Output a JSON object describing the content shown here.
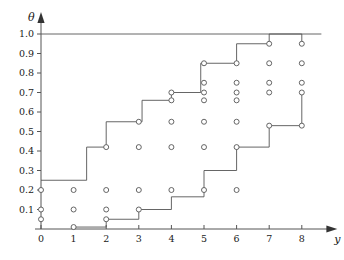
{
  "figure": {
    "title": "",
    "y_axis_name": "θ",
    "x_axis_name": "y",
    "background": "#ffffff",
    "line_color": "#555555",
    "marker_fill": "#ffffff",
    "text_color": "#1a1a1a"
  },
  "chart_data": {
    "type": "scatter",
    "title": "",
    "xlabel": "y",
    "ylabel": "θ",
    "xlim": [
      0,
      8.6
    ],
    "ylim": [
      0.0,
      1.06
    ],
    "grid": false,
    "legend": null,
    "x_ticks": [
      0,
      1,
      2,
      3,
      4,
      5,
      6,
      7,
      8
    ],
    "x_tick_labels": [
      "0",
      "1",
      "2",
      "3",
      "4",
      "5",
      "6",
      "7",
      "8"
    ],
    "y_ticks": [
      0.1,
      0.2,
      0.3,
      0.4,
      0.5,
      0.6,
      0.7,
      0.8,
      0.9,
      1.0
    ],
    "y_tick_labels": [
      "0.1",
      "0.2",
      "0.3",
      "0.4",
      "0.5",
      "0.6",
      "0.7",
      "0.8",
      "0.9",
      "1.0"
    ],
    "annotations": [
      {
        "name": "top-rule",
        "type": "hline",
        "y": 1.0,
        "x_from": 0,
        "x_to": 8.6
      }
    ],
    "series": [
      {
        "name": "points",
        "type": "scatter",
        "marker": "open-circle",
        "points": [
          {
            "x": 0,
            "y": 0.2
          },
          {
            "x": 0,
            "y": 0.1
          },
          {
            "x": 0,
            "y": 0.05
          },
          {
            "x": 1,
            "y": 0.2
          },
          {
            "x": 1,
            "y": 0.1
          },
          {
            "x": 1,
            "y": 0.01
          },
          {
            "x": 2,
            "y": 0.42
          },
          {
            "x": 2,
            "y": 0.2
          },
          {
            "x": 2,
            "y": 0.1
          },
          {
            "x": 2,
            "y": 0.05
          },
          {
            "x": 3,
            "y": 0.55
          },
          {
            "x": 3,
            "y": 0.42
          },
          {
            "x": 3,
            "y": 0.2
          },
          {
            "x": 3,
            "y": 0.1
          },
          {
            "x": 4,
            "y": 0.7
          },
          {
            "x": 4,
            "y": 0.66
          },
          {
            "x": 4,
            "y": 0.55
          },
          {
            "x": 4,
            "y": 0.42
          },
          {
            "x": 4,
            "y": 0.2
          },
          {
            "x": 5,
            "y": 0.85
          },
          {
            "x": 5,
            "y": 0.75
          },
          {
            "x": 5,
            "y": 0.7
          },
          {
            "x": 5,
            "y": 0.66
          },
          {
            "x": 5,
            "y": 0.55
          },
          {
            "x": 5,
            "y": 0.42
          },
          {
            "x": 5,
            "y": 0.2
          },
          {
            "x": 6,
            "y": 0.85
          },
          {
            "x": 6,
            "y": 0.75
          },
          {
            "x": 6,
            "y": 0.7
          },
          {
            "x": 6,
            "y": 0.66
          },
          {
            "x": 6,
            "y": 0.55
          },
          {
            "x": 6,
            "y": 0.42
          },
          {
            "x": 6,
            "y": 0.2
          },
          {
            "x": 7,
            "y": 0.95
          },
          {
            "x": 7,
            "y": 0.85
          },
          {
            "x": 7,
            "y": 0.75
          },
          {
            "x": 7,
            "y": 0.7
          },
          {
            "x": 7,
            "y": 0.53
          },
          {
            "x": 8,
            "y": 0.95
          },
          {
            "x": 8,
            "y": 0.85
          },
          {
            "x": 8,
            "y": 0.75
          },
          {
            "x": 8,
            "y": 0.7
          },
          {
            "x": 8,
            "y": 0.53
          }
        ]
      },
      {
        "name": "upper-staircase",
        "type": "step",
        "vertices": [
          {
            "x": 0.0,
            "y": 0.25
          },
          {
            "x": 1.4,
            "y": 0.25
          },
          {
            "x": 1.4,
            "y": 0.42
          },
          {
            "x": 2.0,
            "y": 0.42
          },
          {
            "x": 2.0,
            "y": 0.55
          },
          {
            "x": 3.1,
            "y": 0.55
          },
          {
            "x": 3.1,
            "y": 0.66
          },
          {
            "x": 4.0,
            "y": 0.66
          },
          {
            "x": 4.0,
            "y": 0.7
          },
          {
            "x": 4.9,
            "y": 0.7
          },
          {
            "x": 4.9,
            "y": 0.85
          },
          {
            "x": 6.0,
            "y": 0.85
          },
          {
            "x": 6.0,
            "y": 0.95
          },
          {
            "x": 7.0,
            "y": 0.95
          },
          {
            "x": 7.0,
            "y": 1.0
          },
          {
            "x": 8.0,
            "y": 1.0
          },
          {
            "x": 8.0,
            "y": 0.95
          }
        ]
      },
      {
        "name": "lower-staircase",
        "type": "step",
        "vertices": [
          {
            "x": 1.0,
            "y": 0.01
          },
          {
            "x": 2.0,
            "y": 0.01
          },
          {
            "x": 2.0,
            "y": 0.05
          },
          {
            "x": 3.0,
            "y": 0.05
          },
          {
            "x": 3.0,
            "y": 0.1
          },
          {
            "x": 4.0,
            "y": 0.1
          },
          {
            "x": 4.0,
            "y": 0.165
          },
          {
            "x": 5.0,
            "y": 0.165
          },
          {
            "x": 5.0,
            "y": 0.3
          },
          {
            "x": 6.0,
            "y": 0.3
          },
          {
            "x": 6.0,
            "y": 0.42
          },
          {
            "x": 7.0,
            "y": 0.42
          },
          {
            "x": 7.0,
            "y": 0.53
          },
          {
            "x": 8.0,
            "y": 0.53
          },
          {
            "x": 8.0,
            "y": 0.7
          }
        ]
      }
    ]
  }
}
